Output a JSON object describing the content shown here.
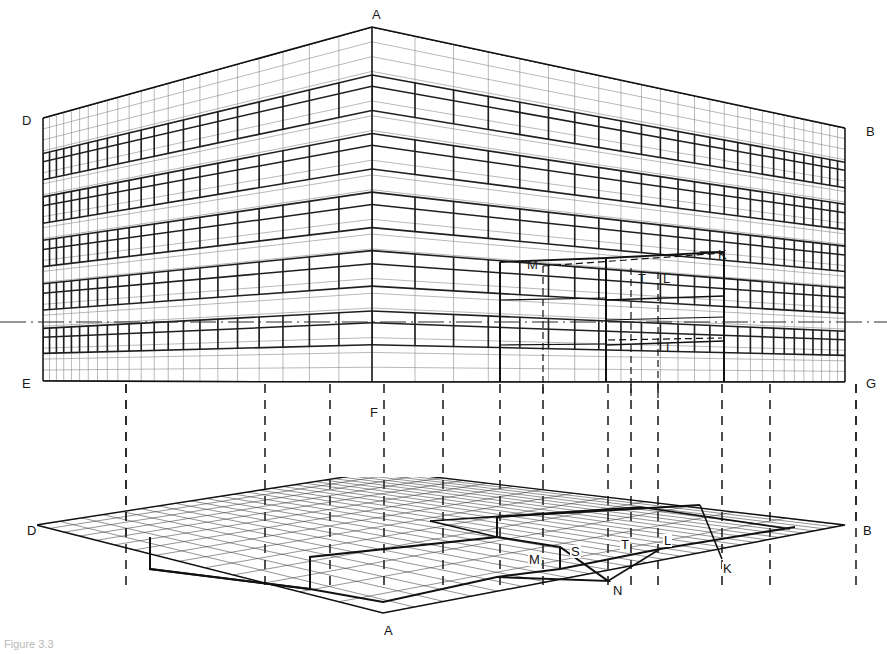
{
  "figure": {
    "caption": "Figure 3.3",
    "type": "two-point perspective construction drawing"
  },
  "elevation": {
    "name": "perspective-elevation",
    "labels": [
      {
        "id": "A",
        "text": "A",
        "x": 372,
        "y": 8,
        "role": "near-vertical-corner-top"
      },
      {
        "id": "D",
        "text": "D",
        "x": 22,
        "y": 114,
        "role": "left-rear-corner-top"
      },
      {
        "id": "B",
        "text": "B",
        "x": 866,
        "y": 125,
        "role": "right-rear-corner-top"
      },
      {
        "id": "E",
        "text": "E",
        "x": 22,
        "y": 377,
        "role": "left-rear-corner-base"
      },
      {
        "id": "G",
        "text": "G",
        "x": 866,
        "y": 377,
        "role": "right-rear-corner-base"
      },
      {
        "id": "F",
        "text": "F",
        "x": 370,
        "y": 406,
        "role": "near-vertical-corner-base"
      },
      {
        "id": "M",
        "text": "M",
        "x": 527,
        "y": 258,
        "role": "setback-left-edge"
      },
      {
        "id": "K",
        "text": "K",
        "x": 718,
        "y": 248,
        "role": "recess-top-edge"
      },
      {
        "id": "T",
        "text": "T",
        "x": 638,
        "y": 272,
        "role": "recess-inner-left"
      },
      {
        "id": "L",
        "text": "L",
        "x": 663,
        "y": 272,
        "role": "recess-inner-right"
      },
      {
        "id": "L2",
        "text": "L",
        "x": 666,
        "y": 341,
        "role": "recess-lower-point"
      }
    ],
    "horizon_line": {
      "label": "horizon",
      "y": 322,
      "style": "dash-dot"
    },
    "storeys": 6,
    "bays_left_face": 22,
    "bays_right_face": 26
  },
  "plan": {
    "name": "perspective-plan",
    "labels": [
      {
        "id": "D",
        "text": "D",
        "x": 26,
        "y": 524,
        "role": "plan-left-corner"
      },
      {
        "id": "B",
        "text": "B",
        "x": 862,
        "y": 524,
        "role": "plan-right-corner"
      },
      {
        "id": "A",
        "text": "A",
        "x": 383,
        "y": 624,
        "role": "plan-near-corner"
      },
      {
        "id": "M",
        "text": "M",
        "x": 528,
        "y": 553,
        "role": "plan-setback-left"
      },
      {
        "id": "S",
        "text": "S",
        "x": 570,
        "y": 545,
        "role": "plan-setback-inner"
      },
      {
        "id": "T",
        "text": "T",
        "x": 620,
        "y": 538,
        "role": "plan-recess-left"
      },
      {
        "id": "L",
        "text": "L",
        "x": 663,
        "y": 534,
        "role": "plan-recess-right"
      },
      {
        "id": "K",
        "text": "K",
        "x": 722,
        "y": 562,
        "role": "plan-recess-far"
      },
      {
        "id": "N",
        "text": "N",
        "x": 612,
        "y": 584,
        "role": "plan-near-setback"
      }
    ],
    "grid_u_divisions": 26,
    "grid_v_divisions": 14
  },
  "projection_lines": {
    "name": "vertical-projection-lines",
    "style": "dashed",
    "x_positions": [
      126,
      265,
      330,
      384,
      443,
      500,
      543,
      608,
      631,
      658,
      722,
      770,
      856
    ],
    "y_top": 384,
    "y_bottom": 585
  },
  "colors": {
    "ink": "#1a1a1a",
    "heavy": "#111111",
    "light": "#6e6e6e",
    "faint": "#9a9a9a",
    "paper": "#ffffff",
    "caption": "#b9b9b9"
  }
}
